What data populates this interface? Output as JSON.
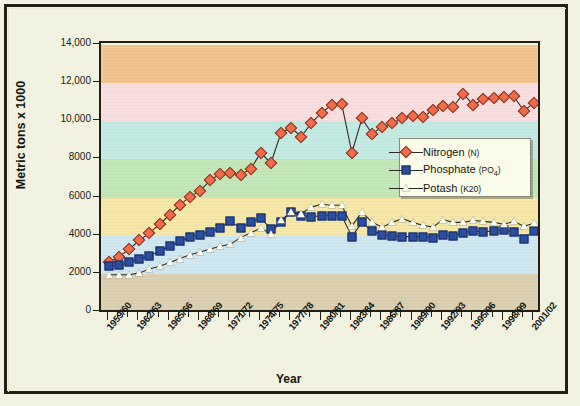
{
  "figure": {
    "background_color": "#f2f2e0",
    "frame_color": "#231f16",
    "plot_border_color": "#231f16"
  },
  "axes": {
    "y_title": "Metric tons x 1000",
    "x_title": "Year",
    "y_ticks": [
      "14,000",
      "12,000",
      "10,000",
      "8000",
      "6000",
      "4000",
      "2000",
      "0"
    ],
    "y_tick_values": [
      14000,
      12000,
      10000,
      8000,
      6000,
      4000,
      2000,
      0
    ],
    "y_min": 0,
    "y_max": 14000,
    "x_tick_labels": [
      "1959/60",
      "1962/63",
      "1965/66",
      "1968/69",
      "1971/72",
      "1974/75",
      "1977/78",
      "1980/81",
      "1983/84",
      "1986/87",
      "1989/90",
      "1992/93",
      "1995/96",
      "1998/99",
      "2001/02"
    ]
  },
  "bands": [
    {
      "from": 12000,
      "to": 14000,
      "color": "#f4c48f"
    },
    {
      "from": 10000,
      "to": 12000,
      "color": "#fadfe0"
    },
    {
      "from": 8000,
      "to": 10000,
      "color": "#c4eae4"
    },
    {
      "from": 6000,
      "to": 8000,
      "color": "#c3e7b8"
    },
    {
      "from": 4000,
      "to": 6000,
      "color": "#f6e8a8"
    },
    {
      "from": 2000,
      "to": 4000,
      "color": "#cfe8f2"
    },
    {
      "from": 0,
      "to": 2000,
      "color": "#dbd0b0"
    }
  ],
  "legend": {
    "position": "inside-right-middle",
    "entries": [
      {
        "name": "Nitrogen",
        "formula": "N",
        "marker": "diamond-marker",
        "color": "#f26b4a"
      },
      {
        "name": "Phosphate",
        "formula": "PO4",
        "marker": "square-marker",
        "color": "#2b4fa0"
      },
      {
        "name": "Potash",
        "formula": "K20",
        "marker": "triangle-marker",
        "color": "#fdfdf2"
      }
    ]
  },
  "chart_data": {
    "type": "line",
    "title": "",
    "subtitle": "",
    "xlabel": "Year",
    "ylabel": "Metric tons x 1000",
    "ylim": [
      0,
      14000
    ],
    "grid": false,
    "legend_position": "inside-right-middle",
    "x": [
      "1959/60",
      "1960/61",
      "1961/62",
      "1962/63",
      "1963/64",
      "1964/65",
      "1965/66",
      "1966/67",
      "1967/68",
      "1968/69",
      "1969/70",
      "1970/71",
      "1971/72",
      "1972/73",
      "1973/74",
      "1974/75",
      "1975/76",
      "1976/77",
      "1977/78",
      "1978/79",
      "1979/80",
      "1980/81",
      "1981/82",
      "1982/83",
      "1983/84",
      "1984/85",
      "1985/86",
      "1986/87",
      "1987/88",
      "1988/89",
      "1989/90",
      "1990/91",
      "1991/92",
      "1992/93",
      "1993/94",
      "1994/95",
      "1995/96",
      "1996/97",
      "1997/98",
      "1998/99",
      "1999/00",
      "2000/01",
      "2001/02"
    ],
    "series": [
      {
        "name": "Nitrogen (N)",
        "marker": "diamond",
        "color": "#f26b4a",
        "values": [
          2600,
          2900,
          3300,
          3750,
          4150,
          4600,
          5100,
          5600,
          6050,
          6350,
          6900,
          7250,
          7300,
          7200,
          7500,
          8350,
          7800,
          9400,
          9650,
          9200,
          9900,
          10450,
          10850,
          10900,
          8350,
          10150,
          9350,
          9700,
          9900,
          10150,
          10300,
          10200,
          10600,
          10800,
          10750,
          11450,
          10850,
          11150,
          11200,
          11250,
          11300,
          10550,
          10950
        ]
      },
      {
        "name": "Phosphate (PO4)",
        "marker": "square",
        "color": "#2b4fa0",
        "values": [
          2400,
          2450,
          2600,
          2800,
          2950,
          3200,
          3450,
          3700,
          3950,
          4050,
          4200,
          4400,
          4750,
          4400,
          4700,
          4950,
          4350,
          4700,
          5250,
          5050,
          5000,
          5050,
          5050,
          5050,
          3950,
          4700,
          4250,
          4050,
          4000,
          3950,
          3950,
          3950,
          3900,
          4050,
          4000,
          4150,
          4250,
          4200,
          4250,
          4300,
          4200,
          3850,
          4250
        ]
      },
      {
        "name": "Potash (K20)",
        "marker": "triangle",
        "color": "#fdfdf2",
        "values": [
          1950,
          1950,
          1950,
          2050,
          2250,
          2400,
          2600,
          2800,
          3000,
          3150,
          3300,
          3450,
          3550,
          3900,
          4150,
          4400,
          4100,
          4800,
          5250,
          5150,
          5500,
          5650,
          5600,
          5600,
          4500,
          5250,
          4700,
          4450,
          4700,
          4900,
          4700,
          4550,
          4450,
          4850,
          4700,
          4700,
          4800,
          4750,
          4700,
          4600,
          4750,
          4500,
          4650
        ]
      }
    ]
  }
}
